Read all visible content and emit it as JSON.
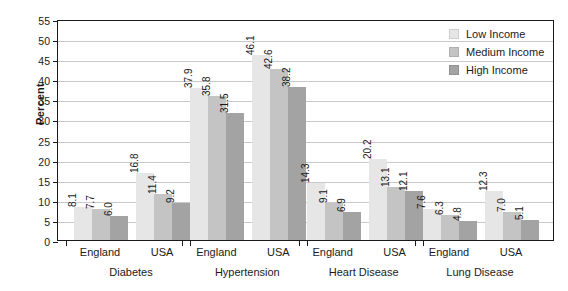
{
  "chart_data": {
    "type": "bar",
    "title": "",
    "xlabel": "",
    "ylabel": "Percent",
    "ylim": [
      0,
      55
    ],
    "yticks": [
      0,
      5,
      10,
      15,
      20,
      25,
      30,
      35,
      40,
      45,
      50,
      55
    ],
    "grid": true,
    "legend_position": "top-right",
    "categories": [
      "Diabetes - England",
      "Diabetes - USA",
      "Hypertension - England",
      "Hypertension - USA",
      "Heart Disease - England",
      "Heart Disease - USA",
      "Lung Disease - England",
      "Lung Disease - USA"
    ],
    "groups": [
      {
        "disease": "Diabetes",
        "countries": [
          {
            "country": "England",
            "values": [
              8.1,
              7.7,
              6.0
            ]
          },
          {
            "country": "USA",
            "values": [
              16.8,
              11.4,
              9.2
            ]
          }
        ]
      },
      {
        "disease": "Hypertension",
        "countries": [
          {
            "country": "England",
            "values": [
              37.9,
              35.8,
              31.5
            ]
          },
          {
            "country": "USA",
            "values": [
              46.1,
              42.6,
              38.2
            ]
          }
        ]
      },
      {
        "disease": "Heart Disease",
        "countries": [
          {
            "country": "England",
            "values": [
              14.3,
              9.1,
              6.9
            ]
          },
          {
            "country": "USA",
            "values": [
              20.2,
              13.1,
              12.1
            ]
          }
        ]
      },
      {
        "disease": "Lung Disease",
        "countries": [
          {
            "country": "England",
            "values": [
              7.6,
              6.3,
              4.8
            ]
          },
          {
            "country": "USA",
            "values": [
              12.3,
              7.0,
              5.1
            ]
          }
        ]
      }
    ],
    "series": [
      {
        "name": "Low Income",
        "color": "#e6e6e6",
        "values": [
          8.1,
          16.8,
          37.9,
          46.1,
          14.3,
          20.2,
          7.6,
          12.3
        ]
      },
      {
        "name": "Medium Income",
        "color": "#c4c4c4",
        "values": [
          7.7,
          11.4,
          35.8,
          42.6,
          9.1,
          13.1,
          6.3,
          7.0
        ]
      },
      {
        "name": "High Income",
        "color": "#a3a3a3",
        "values": [
          6.0,
          9.2,
          31.5,
          38.2,
          6.9,
          12.1,
          4.8,
          5.1
        ]
      }
    ]
  },
  "legend": {
    "items": [
      {
        "label": "Low Income",
        "color": "#e6e6e6"
      },
      {
        "label": "Medium Income",
        "color": "#c4c4c4"
      },
      {
        "label": "High Income",
        "color": "#a3a3a3"
      }
    ]
  },
  "axis": {
    "y_title": "Percent",
    "y_tick_labels": [
      "0",
      "5",
      "10",
      "15",
      "20",
      "25",
      "30",
      "35",
      "40",
      "45",
      "50",
      "55"
    ],
    "x_country_labels": [
      "England",
      "USA",
      "England",
      "USA",
      "England",
      "USA",
      "England",
      "USA"
    ],
    "x_disease_labels": [
      "Diabetes",
      "Hypertension",
      "Heart Disease",
      "Lung Disease"
    ]
  },
  "colors": {
    "axis": "#1a1a1a",
    "grid": "#c9c9c9",
    "background": "#ffffff"
  }
}
